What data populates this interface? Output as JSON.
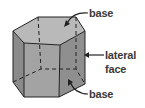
{
  "diagram": {
    "labels": {
      "top_base": "base",
      "lateral_line1": "lateral",
      "lateral_line2": "face",
      "bottom_base": "base"
    },
    "colors": {
      "top_face": "#b9b9b9",
      "front_left_face": "#8a8a8a",
      "front_face": "#a3a3a3",
      "right_face": "#8f8f8f",
      "edge": "#222222",
      "label": "#3a3a3a"
    }
  }
}
